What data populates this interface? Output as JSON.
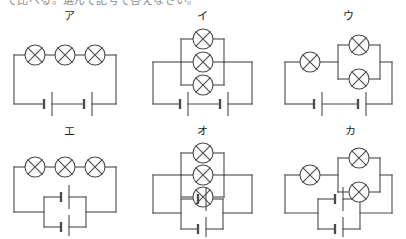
{
  "page": {
    "clipped_header_text": "で比べる。選んで記号で答えなさい。",
    "background_color": "#ffffff",
    "line_color": "#4a4a4a",
    "label_color": "#1f1f1f"
  },
  "legend": {
    "lamp_symbol": "circle-with-cross",
    "battery_symbol": "long-and-short-plate-pair"
  },
  "circuits": [
    {
      "id": "circuit-a",
      "label": "ア",
      "lamp_count": 3,
      "lamp_arrangement": "series",
      "battery_count": 2,
      "battery_arrangement": "series",
      "description": "豆電球3個直列・乾電池2個直列"
    },
    {
      "id": "circuit-i",
      "label": "イ",
      "lamp_count": 3,
      "lamp_arrangement": "parallel",
      "battery_count": 2,
      "battery_arrangement": "series",
      "description": "豆電球3個並列・乾電池2個直列"
    },
    {
      "id": "circuit-u",
      "label": "ウ",
      "lamp_count": 3,
      "lamp_arrangement": "series-parallel",
      "battery_count": 2,
      "battery_arrangement": "series",
      "description": "豆電球1個直列＋2個並列・乾電池2個直列"
    },
    {
      "id": "circuit-e",
      "label": "エ",
      "lamp_count": 3,
      "lamp_arrangement": "series",
      "battery_count": 2,
      "battery_arrangement": "parallel",
      "description": "豆電球3個直列・乾電池2個並列"
    },
    {
      "id": "circuit-o",
      "label": "オ",
      "lamp_count": 3,
      "lamp_arrangement": "parallel",
      "battery_count": 2,
      "battery_arrangement": "parallel",
      "description": "豆電球3個並列・乾電池2個並列"
    },
    {
      "id": "circuit-ka",
      "label": "カ",
      "lamp_count": 3,
      "lamp_arrangement": "series-parallel",
      "battery_count": 2,
      "battery_arrangement": "parallel",
      "description": "豆電球1個直列＋2個並列・乾電池2個並列"
    }
  ]
}
